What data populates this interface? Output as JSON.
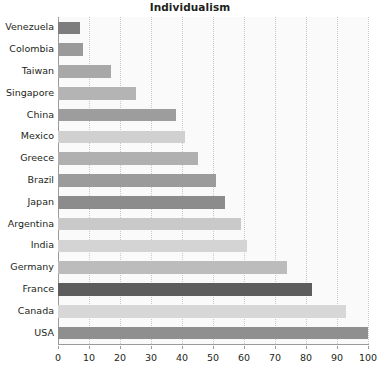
{
  "chart_data": {
    "type": "bar",
    "orientation": "horizontal",
    "title": "Individualism",
    "xlabel": "",
    "ylabel": "",
    "xlim": [
      0,
      100
    ],
    "xticks": [
      0,
      10,
      20,
      30,
      40,
      50,
      60,
      70,
      80,
      90,
      100
    ],
    "xtick_labels": [
      "0",
      "10",
      "20",
      "30",
      "40",
      "50",
      "60",
      "70",
      "80",
      "90",
      "100"
    ],
    "grid": "vertical-dotted",
    "legend": "none",
    "categories": [
      "Venezuela",
      "Colombia",
      "Taiwan",
      "Singapore",
      "China",
      "Mexico",
      "Greece",
      "Brazil",
      "Japan",
      "Argentina",
      "India",
      "Germany",
      "France",
      "Canada",
      "USA"
    ],
    "values": [
      7,
      8,
      17,
      25,
      38,
      41,
      45,
      51,
      54,
      59,
      61,
      74,
      82,
      93,
      100
    ],
    "bar_colors": [
      "#7e7e7e",
      "#9a9a9a",
      "#a8a8a8",
      "#b4b4b4",
      "#9d9d9d",
      "#d0d0d0",
      "#b0b0b0",
      "#9b9b9b",
      "#8c8c8c",
      "#c9c9c9",
      "#d4d4d4",
      "#bcbcbc",
      "#5d5d5d",
      "#d7d7d7",
      "#8f8f8f"
    ],
    "plot_background": "#fafafa",
    "gridline_color": "#c8c8c8",
    "axis_color": "#9a9a9a",
    "text_color": "#231f20"
  }
}
